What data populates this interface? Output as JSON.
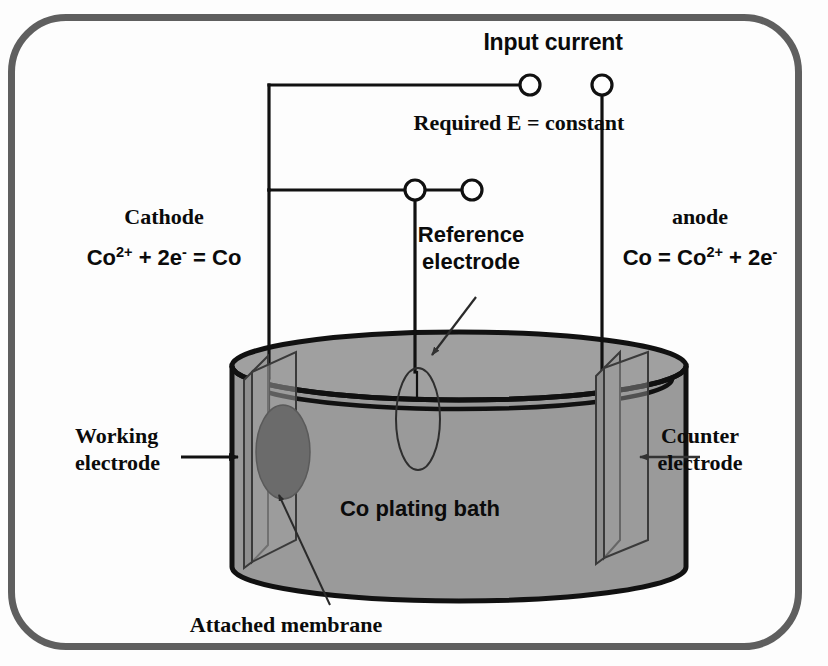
{
  "diagram": {
    "frame_color": "#5f5f5f",
    "bath_fill": "#9a9a9a",
    "membrane_fill": "#6e6e6e",
    "line_color": "#111111"
  },
  "labels": {
    "input_current": "Input current",
    "required_e": "Required E = constant",
    "cathode_title": "Cathode",
    "cathode_equation": "Co2+ + 2e- = Co",
    "cathode_equation_parts": {
      "a": "Co",
      "sup1": "2+",
      "b": " + 2e",
      "sup2": "-",
      "c": " = Co"
    },
    "anode_title": "anode",
    "anode_equation": "Co = Co2+ + 2e-",
    "anode_equation_parts": {
      "a": "Co = Co",
      "sup1": "2+",
      "b": " + 2e",
      "sup2": "-"
    },
    "reference_electrode_line1": "Reference",
    "reference_electrode_line2": "electrode",
    "working_electrode_line1": "Working",
    "working_electrode_line2": "electrode",
    "counter_electrode_line1": "Counter",
    "counter_electrode_line2": "electrode",
    "bath": "Co plating bath",
    "attached_membrane": "Attached membrane"
  },
  "components": {
    "terminals": [
      {
        "name": "working-terminal",
        "cx": 472,
        "cy": 190,
        "r": 10
      },
      {
        "name": "reference-terminal",
        "cx": 530,
        "cy": 85,
        "r": 10
      },
      {
        "name": "reference-probe-terminal",
        "cx": 415,
        "cy": 190,
        "r": 10
      },
      {
        "name": "counter-terminal",
        "cx": 602,
        "cy": 85,
        "r": 10
      }
    ],
    "bath_cylinder": {
      "left": 232,
      "right": 686,
      "top_ellipse_cy": 366,
      "rim_cy": 396,
      "bottom_cy": 567,
      "rx": 227,
      "ry": 34
    },
    "working_electrode_plate": {
      "x": 248,
      "y": 355,
      "w": 48,
      "h": 215
    },
    "counter_electrode_plate": {
      "x": 600,
      "y": 352,
      "w": 48,
      "h": 215
    },
    "membrane_ellipse": {
      "cx": 283,
      "cy": 452,
      "rx": 26,
      "ry": 46
    },
    "reference_probe_ellipse": {
      "cx": 418,
      "cy": 418,
      "rx": 21,
      "ry": 50
    }
  },
  "icons": {
    "arrow_working": "arrow-right-icon",
    "arrow_counter": "arrow-left-icon",
    "arrow_reference": "arrow-pointer-icon",
    "arrow_membrane": "leader-line-icon"
  }
}
